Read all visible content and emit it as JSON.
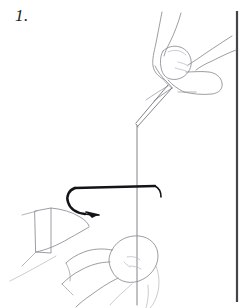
{
  "figure": {
    "step_label": "1.",
    "caption_text": "",
    "style": "line-art-instructional-diagram",
    "colors": {
      "background": "#ffffff",
      "line": "#8b8b92",
      "line_faint": "#b6b6bc",
      "hook": "#141418",
      "border_rule": "#44444a",
      "text": "#1a1a1a"
    },
    "canvas": {
      "width": 243,
      "height": 308
    },
    "elements": {
      "border_rule": "vertical-rule-right",
      "upper_hand": "hand-pinching-tippet-upper-right",
      "lower_hand": "hand-holding-line-lower-center",
      "left_hand_thumb": "thumb-lower-left",
      "hook": "fish-hook",
      "thread": "fishing-line-tippet",
      "thread_loop": "doubled-tippet-strand"
    }
  }
}
